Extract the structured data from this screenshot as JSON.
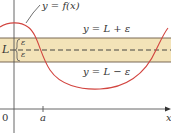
{
  "diagram": {
    "type": "epsilon-band limit illustration",
    "curve_label": "y = f(x)",
    "upper_band_label": "y = L + ε",
    "lower_band_label": "y = L − ε",
    "limit_label": "L",
    "epsilon_upper": "ε",
    "epsilon_lower": "ε",
    "origin_label": "0",
    "a_label": "a",
    "x_axis_label": "x",
    "colors": {
      "band_fill": "#f3e3b8",
      "curve": "#d2443f",
      "axes": "#555555",
      "band_lines": "#6b5a46",
      "dashed_line": "#333333"
    }
  }
}
